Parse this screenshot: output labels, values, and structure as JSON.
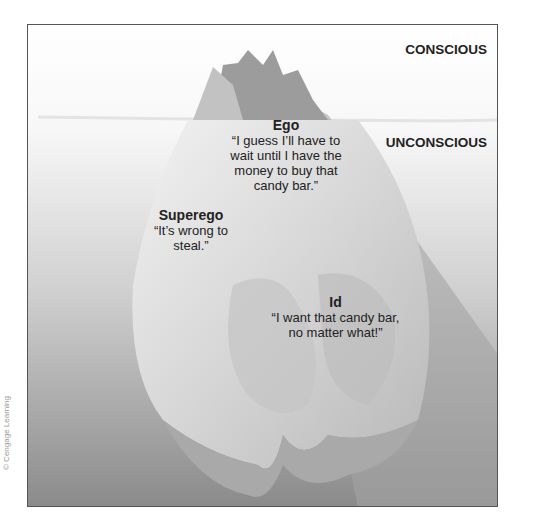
{
  "diagram": {
    "type": "iceberg-model-of-mind",
    "zones": {
      "conscious": "CONSCIOUS",
      "unconscious": "UNCONSCIOUS"
    },
    "labels": {
      "ego": {
        "title": "Ego",
        "quote": "“I guess I’ll have to wait until I have the money to buy that candy bar.”"
      },
      "superego": {
        "title": "Superego",
        "quote": "“It’s wrong to steal.”"
      },
      "id": {
        "title": "Id",
        "quote": "“I want that candy bar, no matter what!”"
      }
    },
    "credit": "© Cengage Learning",
    "colors": {
      "water_top": "#f4f4f4",
      "water_bottom": "#8a8a8a",
      "ice_light": "#e6e6e6",
      "ice_mid": "#c9c9c9",
      "ice_dark": "#9a9a9a",
      "shadow": "#a8a8a8",
      "text": "#222222"
    }
  }
}
